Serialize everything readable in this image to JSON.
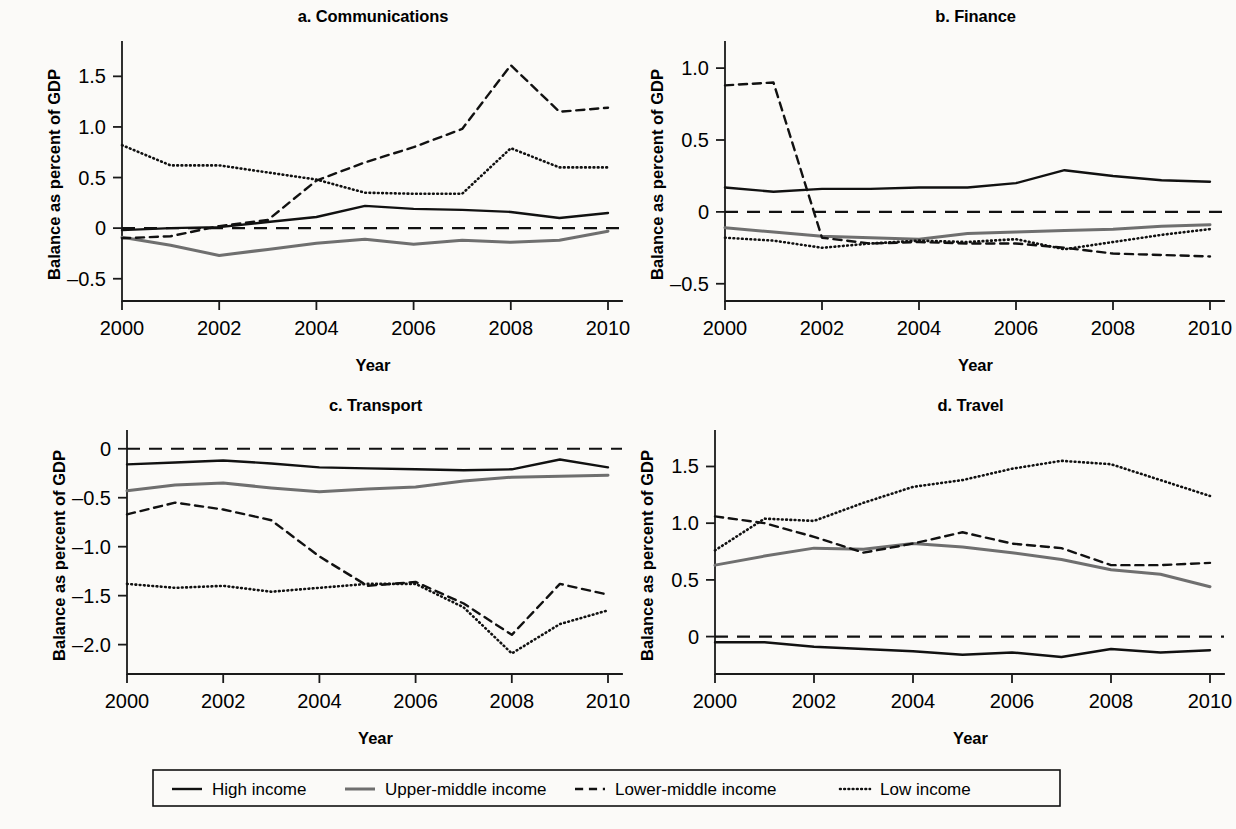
{
  "figure": {
    "background": "#fbfaf8",
    "axis_label_y": "Balance as percent of GDP",
    "axis_label_x": "Year"
  },
  "legend": {
    "position": "bottom-center",
    "entries": [
      {
        "label": "High income",
        "style": "solid",
        "color": "#111111",
        "width": 2.4
      },
      {
        "label": "Upper-middle income",
        "style": "solid",
        "color": "#6f6f6f",
        "width": 3.0
      },
      {
        "label": "Lower-middle income",
        "style": "dashed",
        "color": "#111111",
        "width": 2.4
      },
      {
        "label": "Low income",
        "style": "dotted",
        "color": "#111111",
        "width": 2.6
      }
    ]
  },
  "chart_data": [
    {
      "type": "line",
      "panel": "a",
      "title": "a. Communications",
      "xlabel": "Year",
      "ylabel": "Balance as percent of GDP",
      "x": [
        2000,
        2001,
        2002,
        2003,
        2004,
        2005,
        2006,
        2007,
        2008,
        2009,
        2010
      ],
      "xlim": [
        2000,
        2010
      ],
      "xticks": [
        2000,
        2002,
        2004,
        2006,
        2008,
        2010
      ],
      "xticklabels": [
        "2000",
        "2002",
        "2004",
        "2006",
        "2008",
        "2010"
      ],
      "ylim": [
        -0.72,
        1.78
      ],
      "yticks": [
        -0.5,
        0,
        0.5,
        1.0,
        1.5
      ],
      "yticklabels": [
        "–0.5",
        "0",
        "0.5",
        "1.0",
        "1.5"
      ],
      "zero_line": 0,
      "grid": false,
      "series": [
        {
          "name": "High income",
          "values": [
            -0.02,
            0.0,
            0.01,
            0.06,
            0.11,
            0.22,
            0.19,
            0.18,
            0.16,
            0.1,
            0.15
          ]
        },
        {
          "name": "Upper-middle income",
          "values": [
            -0.09,
            -0.17,
            -0.27,
            -0.21,
            -0.15,
            -0.11,
            -0.16,
            -0.12,
            -0.14,
            -0.12,
            -0.03
          ]
        },
        {
          "name": "Lower-middle income",
          "values": [
            -0.1,
            -0.08,
            0.02,
            0.08,
            0.47,
            0.65,
            0.8,
            0.98,
            1.61,
            1.15,
            1.19
          ]
        },
        {
          "name": "Low income",
          "values": [
            0.82,
            0.62,
            0.62,
            0.55,
            0.48,
            0.35,
            0.34,
            0.34,
            0.79,
            0.6,
            0.6
          ]
        }
      ]
    },
    {
      "type": "line",
      "panel": "b",
      "title": "b. Finance",
      "xlabel": "Year",
      "ylabel": "Balance as percent of GDP",
      "x": [
        2000,
        2001,
        2002,
        2003,
        2004,
        2005,
        2006,
        2007,
        2008,
        2009,
        2010
      ],
      "xlim": [
        2000,
        2010
      ],
      "xticks": [
        2000,
        2002,
        2004,
        2006,
        2008,
        2010
      ],
      "xticklabels": [
        "2000",
        "2002",
        "2004",
        "2006",
        "2008",
        "2010"
      ],
      "ylim": [
        -0.62,
        1.14
      ],
      "yticks": [
        -0.5,
        0,
        0.5,
        1.0
      ],
      "yticklabels": [
        "–0.5",
        "0",
        "0.5",
        "1.0"
      ],
      "zero_line": 0,
      "grid": false,
      "series": [
        {
          "name": "High income",
          "values": [
            0.17,
            0.14,
            0.16,
            0.16,
            0.17,
            0.17,
            0.2,
            0.29,
            0.25,
            0.22,
            0.21
          ]
        },
        {
          "name": "Upper-middle income",
          "values": [
            -0.11,
            -0.14,
            -0.17,
            -0.18,
            -0.19,
            -0.15,
            -0.14,
            -0.13,
            -0.12,
            -0.1,
            -0.09
          ]
        },
        {
          "name": "Lower-middle income",
          "values": [
            0.88,
            0.9,
            -0.18,
            -0.22,
            -0.21,
            -0.22,
            -0.22,
            -0.25,
            -0.29,
            -0.3,
            -0.31
          ]
        },
        {
          "name": "Low income",
          "values": [
            -0.18,
            -0.2,
            -0.25,
            -0.22,
            -0.2,
            -0.21,
            -0.19,
            -0.26,
            -0.21,
            -0.16,
            -0.12
          ]
        }
      ]
    },
    {
      "type": "line",
      "panel": "c",
      "title": "c. Transport",
      "xlabel": "Year",
      "ylabel": "Balance as percent of GDP",
      "x": [
        2000,
        2001,
        2002,
        2003,
        2004,
        2005,
        2006,
        2007,
        2008,
        2009,
        2010
      ],
      "xlim": [
        2000,
        2010
      ],
      "xticks": [
        2000,
        2002,
        2004,
        2006,
        2008,
        2010
      ],
      "xticklabels": [
        "2000",
        "2002",
        "2004",
        "2006",
        "2008",
        "2010"
      ],
      "ylim": [
        -2.3,
        0.12
      ],
      "yticks": [
        -2.0,
        -1.5,
        -1.0,
        -0.5,
        0
      ],
      "yticklabels": [
        "–2.0",
        "–1.5",
        "–1.0",
        "–0.5",
        "0"
      ],
      "zero_line": 0,
      "grid": false,
      "series": [
        {
          "name": "High income",
          "values": [
            -0.16,
            -0.14,
            -0.12,
            -0.15,
            -0.19,
            -0.2,
            -0.21,
            -0.22,
            -0.21,
            -0.11,
            -0.19
          ]
        },
        {
          "name": "Upper-middle income",
          "values": [
            -0.43,
            -0.37,
            -0.35,
            -0.4,
            -0.44,
            -0.41,
            -0.39,
            -0.33,
            -0.29,
            -0.28,
            -0.27
          ]
        },
        {
          "name": "Lower-middle income",
          "values": [
            -0.67,
            -0.55,
            -0.62,
            -0.73,
            -1.1,
            -1.4,
            -1.36,
            -1.58,
            -1.9,
            -1.38,
            -1.49
          ]
        },
        {
          "name": "Low income",
          "values": [
            -1.38,
            -1.42,
            -1.4,
            -1.46,
            -1.42,
            -1.38,
            -1.38,
            -1.62,
            -2.09,
            -1.79,
            -1.65
          ]
        }
      ]
    },
    {
      "type": "line",
      "panel": "d",
      "title": "d. Travel",
      "xlabel": "Year",
      "ylabel": "Balance as percent of GDP",
      "x": [
        2000,
        2001,
        2002,
        2003,
        2004,
        2005,
        2006,
        2007,
        2008,
        2009,
        2010
      ],
      "xlim": [
        2000,
        2010
      ],
      "xticks": [
        2000,
        2002,
        2004,
        2006,
        2008,
        2010
      ],
      "xticklabels": [
        "2000",
        "2002",
        "2004",
        "2006",
        "2008",
        "2010"
      ],
      "ylim": [
        -0.33,
        1.76
      ],
      "yticks": [
        0,
        0.5,
        1.0,
        1.5
      ],
      "yticklabels": [
        "0",
        "0.5",
        "1.0",
        "1.5"
      ],
      "zero_line": 0,
      "grid": false,
      "series": [
        {
          "name": "High income",
          "values": [
            -0.05,
            -0.05,
            -0.09,
            -0.11,
            -0.13,
            -0.16,
            -0.14,
            -0.18,
            -0.11,
            -0.14,
            -0.12
          ]
        },
        {
          "name": "Upper-middle income",
          "values": [
            0.63,
            0.71,
            0.78,
            0.77,
            0.82,
            0.79,
            0.74,
            0.68,
            0.59,
            0.55,
            0.44
          ]
        },
        {
          "name": "Lower-middle income",
          "values": [
            1.06,
            1.0,
            0.88,
            0.74,
            0.82,
            0.92,
            0.82,
            0.78,
            0.63,
            0.63,
            0.65
          ]
        },
        {
          "name": "Low income",
          "values": [
            0.76,
            1.04,
            1.02,
            1.18,
            1.32,
            1.38,
            1.48,
            1.55,
            1.52,
            1.38,
            1.24
          ]
        }
      ]
    }
  ]
}
